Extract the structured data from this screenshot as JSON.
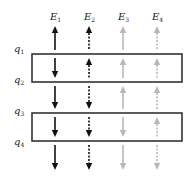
{
  "diagram": {
    "columns": [
      {
        "label": "E",
        "sub": "1",
        "x": 55,
        "style": "solid",
        "color": "#111111",
        "directions": [
          "up",
          "down",
          "down",
          "down",
          "down"
        ]
      },
      {
        "label": "E",
        "sub": "2",
        "x": 89,
        "style": "dashed",
        "color": "#111111",
        "directions": [
          "up",
          "up",
          "down",
          "down",
          "down"
        ]
      },
      {
        "label": "E",
        "sub": "3",
        "x": 123,
        "style": "solid",
        "color": "#b8b8b8",
        "directions": [
          "up",
          "up",
          "up",
          "down",
          "down"
        ]
      },
      {
        "label": "E",
        "sub": "4",
        "x": 157,
        "style": "dashed",
        "color": "#b8b8b8",
        "directions": [
          "up",
          "up",
          "up",
          "up",
          "down"
        ]
      }
    ],
    "row_labels": [
      {
        "label": "q",
        "sub": "1",
        "y": 52
      },
      {
        "label": "q",
        "sub": "2",
        "y": 83
      },
      {
        "label": "q",
        "sub": "3",
        "y": 114
      },
      {
        "label": "q",
        "sub": "4",
        "y": 145
      }
    ],
    "boxes": [
      {
        "name": "interval-q1-q2",
        "x": 32,
        "y": 54,
        "w": 150,
        "h": 28
      },
      {
        "name": "interval-q3-q4",
        "x": 32,
        "y": 113,
        "w": 150,
        "h": 28
      }
    ],
    "rows_y": [
      [
        26,
        50
      ],
      [
        58,
        78
      ],
      [
        86,
        109
      ],
      [
        117,
        137
      ],
      [
        145,
        170
      ]
    ]
  }
}
